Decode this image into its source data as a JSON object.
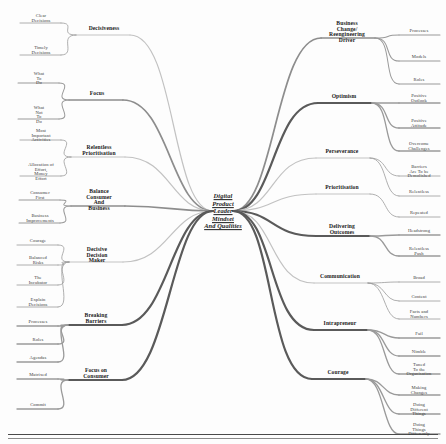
{
  "diagram": {
    "type": "mind-map",
    "title": "Digital Product Leader Mindset And Qualities",
    "central_node": {
      "label": "Digital\nProduct\nLeader\nMindset\nAnd Qualities",
      "x": 223,
      "y": 211
    },
    "colors": {
      "background": "#fdfdfd",
      "text": "#2a2a2a",
      "branch_dark": "#5a5a5a",
      "branch_mid": "#8d8d8d",
      "branch_light": "#c2c2c2",
      "leaf_line": "#9a9a9a",
      "rule": "#4a4a4a"
    },
    "left_branches": [
      {
        "label": "Decisiveness",
        "x": 104,
        "y": 35,
        "weight": "light",
        "leaves": [
          {
            "label": "Clear\nDecisions",
            "x": 41,
            "y": 19
          },
          {
            "label": "Timely\nDecisions",
            "x": 41,
            "y": 51
          }
        ]
      },
      {
        "label": "Focus",
        "x": 97,
        "y": 100,
        "weight": "mid",
        "leaves": [
          {
            "label": "What\nTo\nDo",
            "x": 39,
            "y": 79
          },
          {
            "label": "What\nNot\nTo\nDo",
            "x": 39,
            "y": 115
          }
        ]
      },
      {
        "label": "Relentless\nPrioritisation",
        "x": 99,
        "y": 157,
        "weight": "light",
        "leaves": [
          {
            "label": "Most\nImportant\nActivities",
            "x": 41,
            "y": 136
          },
          {
            "label": "Allocation of\nEffort,\nMoney\nEffort",
            "x": 41,
            "y": 172
          }
        ]
      },
      {
        "label": "Balance\nConsumer\nAnd\nBusiness",
        "x": 99,
        "y": 206,
        "weight": "mid",
        "leaves": [
          {
            "label": "Consumer\nFirst",
            "x": 40,
            "y": 196
          },
          {
            "label": "Business\nImprovements",
            "x": 40,
            "y": 219
          }
        ]
      },
      {
        "label": "Decisive\nDecision\nMaker",
        "x": 97,
        "y": 262,
        "weight": "light",
        "leaves": [
          {
            "label": "Courage",
            "x": 38,
            "y": 241
          },
          {
            "label": "Balanced\nRisks",
            "x": 38,
            "y": 261
          },
          {
            "label": "The\nIncubator",
            "x": 38,
            "y": 281
          },
          {
            "label": "Explain\nDecisions",
            "x": 38,
            "y": 303
          }
        ]
      },
      {
        "label": "Breaking\nBarriers",
        "x": 96,
        "y": 325,
        "weight": "dark",
        "leaves": [
          {
            "label": "Processes",
            "x": 38,
            "y": 322
          },
          {
            "label": "Roles",
            "x": 38,
            "y": 340
          },
          {
            "label": "Agendas",
            "x": 38,
            "y": 358
          }
        ]
      },
      {
        "label": "Focus on\nConsumer",
        "x": 96,
        "y": 380,
        "weight": "dark",
        "leaves": [
          {
            "label": "Matrixed",
            "x": 38,
            "y": 375
          },
          {
            "label": "Commit",
            "x": 38,
            "y": 405
          }
        ]
      }
    ],
    "right_branches": [
      {
        "label": "Business\nChange/\nReengineering\nDriver",
        "x": 347,
        "y": 38,
        "weight": "mid",
        "leaves": [
          {
            "label": "Processes",
            "x": 419,
            "y": 31
          },
          {
            "label": "Models",
            "x": 419,
            "y": 57
          },
          {
            "label": "Roles",
            "x": 419,
            "y": 80
          }
        ]
      },
      {
        "label": "Optimism",
        "x": 344,
        "y": 103,
        "weight": "dark",
        "leaves": [
          {
            "label": "Positive\nOutlook",
            "x": 419,
            "y": 99
          },
          {
            "label": "Positive\nAttitude",
            "x": 419,
            "y": 124
          },
          {
            "label": "Overcome\nChallenges",
            "x": 419,
            "y": 147
          }
        ]
      },
      {
        "label": "Perseverance",
        "x": 342,
        "y": 158,
        "weight": "light",
        "leaves": [
          {
            "label": "Barriers\nAre To be\nDemolished",
            "x": 419,
            "y": 172
          },
          {
            "label": "Relentless",
            "x": 419,
            "y": 192
          }
        ]
      },
      {
        "label": "Prioritisation",
        "x": 342,
        "y": 194,
        "weight": "light",
        "leaves": [
          {
            "label": "Repeated",
            "x": 419,
            "y": 213
          }
        ]
      },
      {
        "label": "Delivering\nOutcomes",
        "x": 342,
        "y": 236,
        "weight": "dark",
        "leaves": [
          {
            "label": "Headstrong",
            "x": 419,
            "y": 231
          },
          {
            "label": "Relentless\nPush",
            "x": 419,
            "y": 252
          }
        ]
      },
      {
        "label": "Communication",
        "x": 340,
        "y": 283,
        "weight": "light",
        "leaves": [
          {
            "label": "Broad",
            "x": 419,
            "y": 278
          },
          {
            "label": "Content",
            "x": 419,
            "y": 297
          },
          {
            "label": "Facts and\nNumbers",
            "x": 419,
            "y": 315
          }
        ]
      },
      {
        "label": "Intrapreneur",
        "x": 340,
        "y": 330,
        "weight": "dark",
        "leaves": [
          {
            "label": "Fail",
            "x": 419,
            "y": 334
          },
          {
            "label": "Nimble",
            "x": 419,
            "y": 352
          },
          {
            "label": "Tuned\nTo the\nOrganisation",
            "x": 419,
            "y": 370
          }
        ]
      },
      {
        "label": "Courage",
        "x": 338,
        "y": 379,
        "weight": "dark",
        "leaves": [
          {
            "label": "Making\nChanges",
            "x": 419,
            "y": 391
          },
          {
            "label": "Doing\nDifferent\nThings",
            "x": 419,
            "y": 410
          },
          {
            "label": "Doing\nThings\nDifferently",
            "x": 419,
            "y": 430
          }
        ]
      }
    ]
  }
}
